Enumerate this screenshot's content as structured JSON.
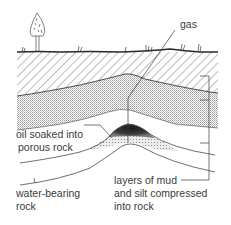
{
  "diagram": {
    "labels": {
      "gas": "gas",
      "oil_line1": "oil soaked into",
      "oil_line2": "porous rock",
      "water_line1": "water-bearing",
      "water_line2": "rock",
      "layers_line1": "layers of mud",
      "layers_line2": "and silt compressed",
      "layers_line3": "into rock"
    },
    "colors": {
      "ink": "#3a3a3a",
      "hatch": "#6a6a6a",
      "stipple": "#cfcfcf",
      "oil": "#2a2a2a",
      "porous": "#e0e0e0",
      "background": "#ffffff"
    },
    "icons": [
      "tree-icon",
      "grass-tufts"
    ]
  }
}
